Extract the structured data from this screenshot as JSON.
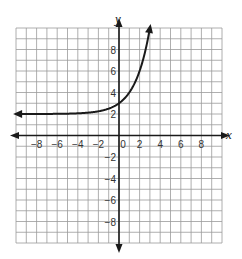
{
  "chart_data": {
    "type": "line",
    "title": "",
    "xlabel": "x",
    "ylabel": "y",
    "xlim": [
      -10,
      10
    ],
    "ylim": [
      -10,
      10
    ],
    "grid": true,
    "grid_step": 1,
    "x_ticks": [
      -8,
      -6,
      -4,
      -2,
      0,
      2,
      4,
      6,
      8
    ],
    "y_ticks": [
      -8,
      -6,
      -4,
      -2,
      2,
      4,
      6,
      8
    ],
    "x_tick_labels": [
      "−8",
      "−6",
      "−4",
      "−2",
      "0",
      "2",
      "4",
      "6",
      "8"
    ],
    "y_tick_labels": [
      "−8",
      "−6",
      "−4",
      "−2",
      "2",
      "4",
      "6",
      "8"
    ],
    "series": [
      {
        "name": "exponential curve",
        "function": "y = 2^x + 2",
        "asymptote_y": 2,
        "x": [
          -10,
          -8,
          -6,
          -4,
          -2,
          -1,
          0,
          1,
          2,
          2.5
        ],
        "values": [
          2.0,
          2.0,
          2.02,
          2.06,
          2.25,
          2.5,
          3,
          4,
          6,
          7.66
        ],
        "left_arrow": true,
        "right_arrow": true
      }
    ],
    "legend": null
  },
  "colors": {
    "grid": "#9a9a9a",
    "axis": "#1a1a1a",
    "curve": "#1a1a1a"
  }
}
